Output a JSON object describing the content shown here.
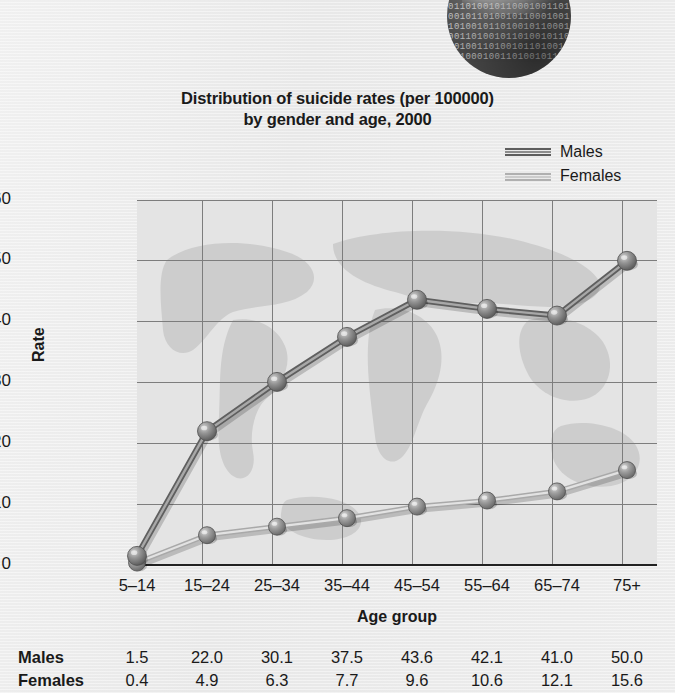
{
  "title_line1": "Distribution of suicide rates (per 100000)",
  "title_line2": "by gender and age, 2000",
  "legend": {
    "males": "Males",
    "females": "Females"
  },
  "decorative": {
    "globe_binary": "0110100101100010011010010110100101100010011010010110100101100010011010010110100101100010011010010110100101100010011010010110"
  },
  "chart_data": {
    "type": "line",
    "title": "Distribution of suicide rates (per 100000) by gender and age, 2000",
    "xlabel": "Age group",
    "ylabel": "Rate",
    "categories": [
      "5–14",
      "15–24",
      "25–34",
      "35–44",
      "45–54",
      "55–64",
      "65–74",
      "75+"
    ],
    "series": [
      {
        "name": "Males",
        "values": [
          1.5,
          22.0,
          30.1,
          37.5,
          43.6,
          42.1,
          41.0,
          50.0
        ],
        "color": "#6e6e6e"
      },
      {
        "name": "Females",
        "values": [
          0.4,
          4.9,
          6.3,
          7.7,
          9.6,
          10.6,
          12.1,
          15.6
        ],
        "color": "#bdbdbd"
      }
    ],
    "ylim": [
      0,
      60
    ],
    "yticks": [
      0,
      10,
      20,
      30,
      40,
      50,
      60
    ],
    "ytick_labels": [
      "0",
      "10",
      "20",
      "30",
      "40",
      "50",
      "60"
    ],
    "grid": true,
    "legend_position": "top-right"
  },
  "table": {
    "rows": [
      {
        "label": "Males",
        "values": [
          "1.5",
          "22.0",
          "30.1",
          "37.5",
          "43.6",
          "42.1",
          "41.0",
          "50.0"
        ]
      },
      {
        "label": "Females",
        "values": [
          "0.4",
          "4.9",
          "6.3",
          "7.7",
          "9.6",
          "10.6",
          "12.1",
          "15.6"
        ]
      }
    ]
  }
}
